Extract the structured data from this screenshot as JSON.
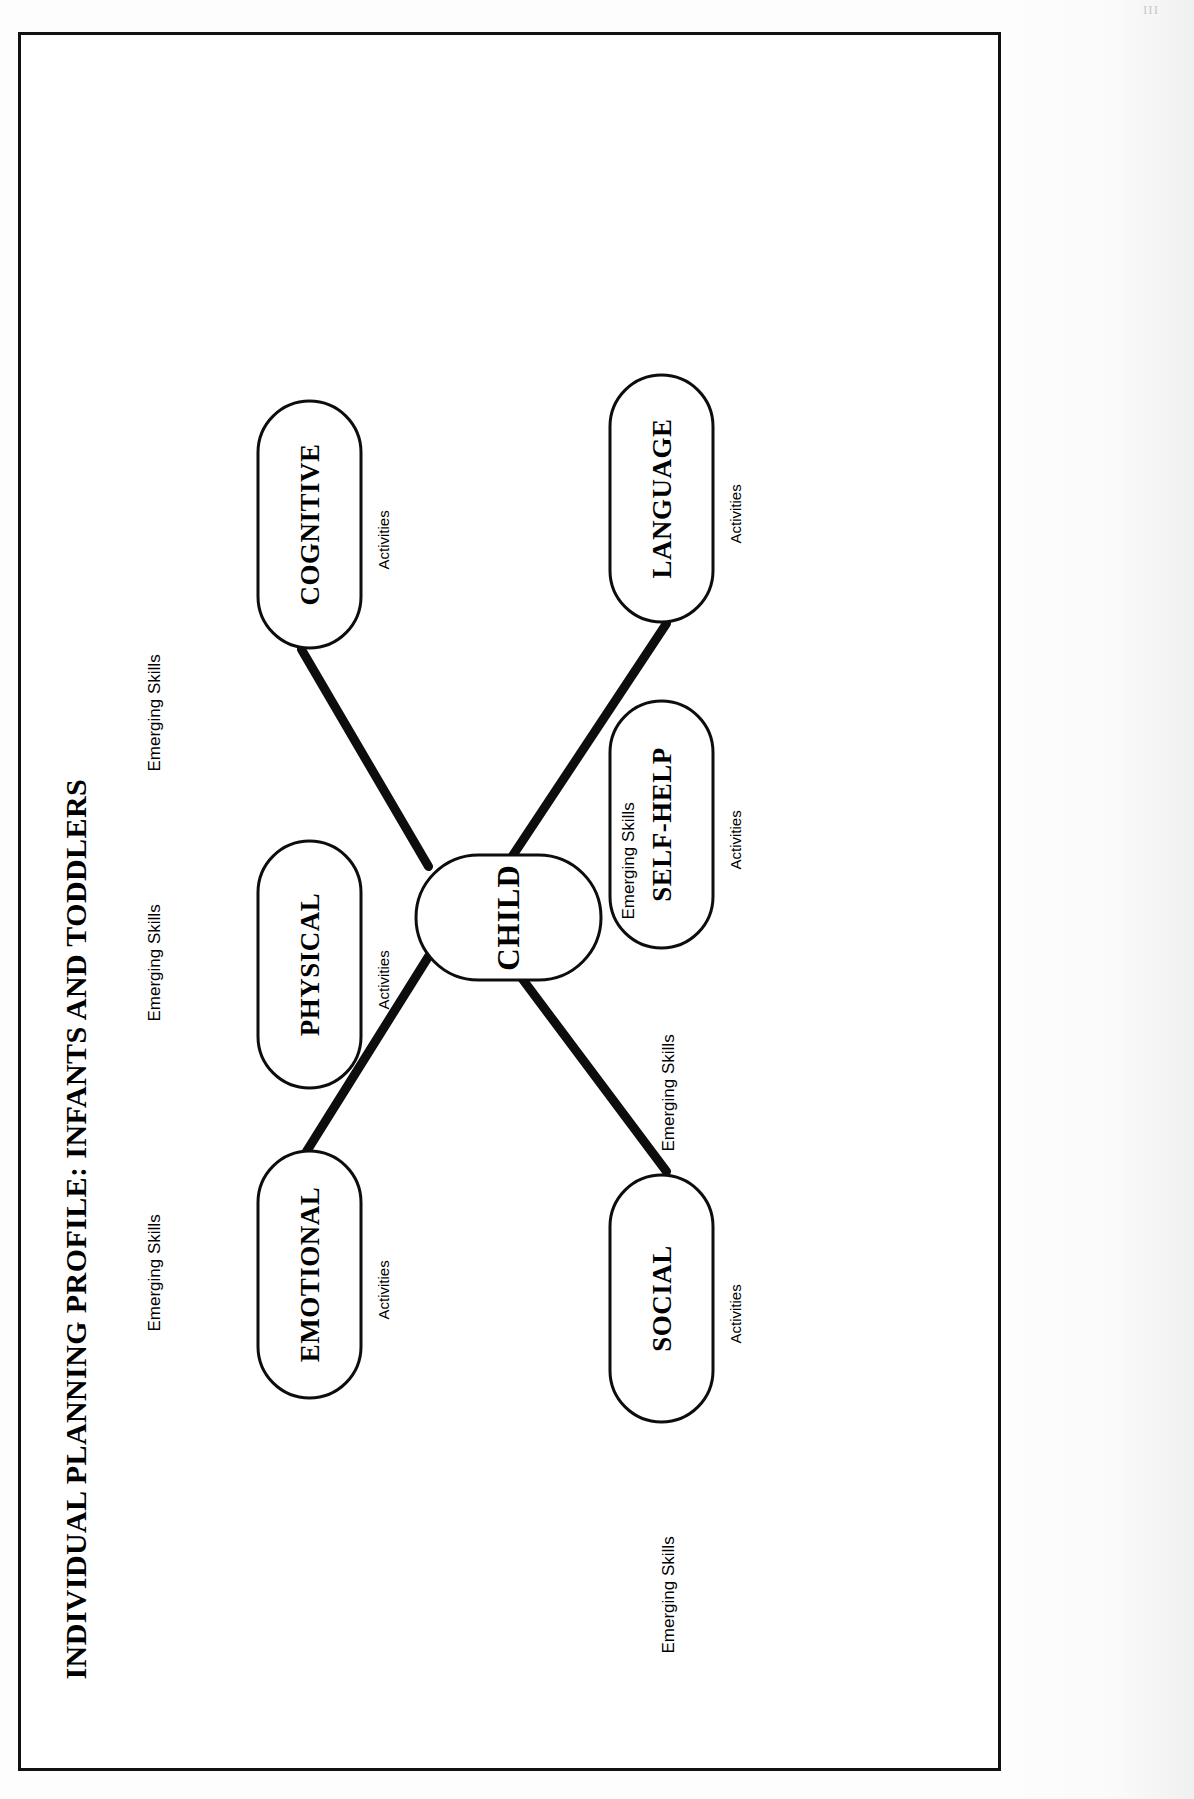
{
  "document": {
    "title": "INDIVIDUAL PLANNING PROFILE:  INFANTS AND TODDLERS",
    "corner_mark": "III"
  },
  "diagram": {
    "type": "concept-map",
    "orientation": "rotated-90-counterclockwise",
    "center": {
      "id": "child",
      "label": "CHILD",
      "emerging_skills_label": "Emerging Skills"
    },
    "activities_label": "Activities",
    "emerging_skills_label": "Emerging Skills",
    "nodes": [
      {
        "id": "emotional",
        "label": "EMOTIONAL",
        "activities": "Activities",
        "emerging": "Emerging Skills",
        "connected": true
      },
      {
        "id": "physical",
        "label": "PHYSICAL",
        "activities": "Activities",
        "emerging": "Emerging Skills",
        "connected": false
      },
      {
        "id": "social",
        "label": "SOCIAL",
        "activities": "Activities",
        "emerging": "Emerging Skills",
        "connected": true
      },
      {
        "id": "cognitive",
        "label": "COGNITIVE",
        "activities": "Activities",
        "emerging": "Emerging Skills",
        "connected": true
      },
      {
        "id": "selfhelp",
        "label": "SELF-HELP",
        "activities": "Activities",
        "emerging": "Emerging Skills",
        "connected": false
      },
      {
        "id": "language",
        "label": "LANGUAGE",
        "activities": "Activities",
        "emerging": "Emerging Skills",
        "connected": true
      }
    ],
    "colors": {
      "ink": "#0d0d0d",
      "paper": "#ffffff",
      "border": "#111111"
    }
  }
}
